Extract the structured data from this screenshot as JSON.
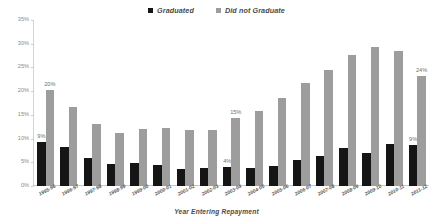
{
  "chart_data": {
    "type": "bar",
    "title": "",
    "xlabel": "Year Entering Repayment",
    "ylabel": "",
    "ylim": [
      0,
      35
    ],
    "ytick_labels": [
      "0%",
      "5%",
      "10%",
      "15%",
      "20%",
      "25%",
      "30%",
      "35%"
    ],
    "ytick_values": [
      0,
      5,
      10,
      15,
      20,
      25,
      30,
      35
    ],
    "grid": false,
    "legend_position": "top-center",
    "categories": [
      "1995-96",
      "1996-97",
      "1997-98",
      "1998-99",
      "1999-00",
      "2000-01",
      "2001-02",
      "2002-03",
      "2003-04",
      "2004-05",
      "2005-06",
      "2006-07",
      "2007-08",
      "2008-09",
      "2009-10",
      "2010-11",
      "2011-12"
    ],
    "series": [
      {
        "name": "Graduated",
        "color": "#151515",
        "values": [
          9.3,
          8.2,
          6.0,
          4.6,
          4.8,
          4.4,
          3.6,
          3.7,
          4.0,
          3.9,
          4.3,
          5.5,
          6.3,
          8.0,
          6.9,
          8.9,
          8.7
        ],
        "point_labels": [
          "9%",
          "",
          "",
          "",
          "",
          "",
          "",
          "",
          "4%",
          "",
          "",
          "",
          "",
          "",
          "",
          "",
          "9%"
        ]
      },
      {
        "name": "Did not Graduate",
        "color": "#9d9d9d",
        "values": [
          20.3,
          16.7,
          13.0,
          11.1,
          12.0,
          12.2,
          11.9,
          11.8,
          14.3,
          15.8,
          18.5,
          21.8,
          24.4,
          27.7,
          29.3,
          28.5,
          23.1
        ],
        "point_labels": [
          "20%",
          "",
          "",
          "",
          "",
          "",
          "",
          "",
          "15%",
          "",
          "",
          "",
          "",
          "",
          "",
          "",
          "24%"
        ]
      }
    ]
  },
  "legend": {
    "items": [
      {
        "label": "Graduated",
        "color": "#151515"
      },
      {
        "label": "Did not Graduate",
        "color": "#9d9d9d"
      }
    ]
  }
}
